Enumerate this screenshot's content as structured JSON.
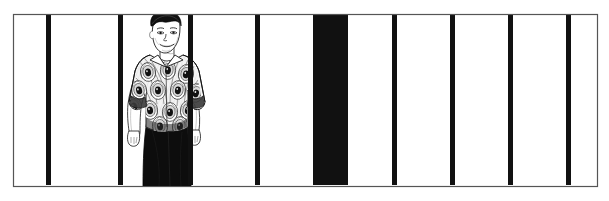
{
  "image": {
    "kind": "comic-panel-illustration",
    "title": "Man standing behind vertical bars",
    "caption": "Black and white comic panel: a smiling young man in a peacock-feather patterned short-sleeve shirt and dark trousers stands behind a row of vertical bars; one bar column is solid black.",
    "width_px": 609,
    "height_px": 201,
    "background_color": "#ffffff",
    "ink_color": "#111111",
    "paper_color": "#fcfcfc"
  },
  "frame": {
    "name": "panel-border",
    "left_px": 13,
    "top_px": 14,
    "right_px": 597,
    "bottom_px": 186,
    "stroke_color": "#555555",
    "stroke_width_px": 1.2
  },
  "bars": {
    "label": "vertical bars",
    "color": "#111111",
    "count": 11,
    "top_px": 15,
    "bottom_px": 185,
    "items": [
      {
        "name": "bar-1",
        "x_px": 46,
        "width_px": 5,
        "fill": "solid-black"
      },
      {
        "name": "bar-2",
        "x_px": 118,
        "width_px": 5,
        "fill": "solid-black"
      },
      {
        "name": "bar-3",
        "x_px": 188,
        "width_px": 5,
        "fill": "solid-black"
      },
      {
        "name": "bar-4",
        "x_px": 255,
        "width_px": 5,
        "fill": "solid-black"
      },
      {
        "name": "bar-5-wide-black-column",
        "x_px": 313,
        "width_px": 35,
        "fill": "solid-black"
      },
      {
        "name": "bar-6",
        "x_px": 392,
        "width_px": 5,
        "fill": "solid-black"
      },
      {
        "name": "bar-7",
        "x_px": 450,
        "width_px": 5,
        "fill": "solid-black"
      },
      {
        "name": "bar-8",
        "x_px": 508,
        "width_px": 5,
        "fill": "solid-black"
      },
      {
        "name": "bar-9",
        "x_px": 566,
        "width_px": 5,
        "fill": "solid-black"
      }
    ]
  },
  "figure": {
    "name": "standing-man",
    "center_x_px": 166,
    "head_top_px": 16,
    "feet_px": 186,
    "hair_color": "#111111",
    "skin_color": "#ffffff",
    "shirt": {
      "name": "peacock-pattern-shirt",
      "pattern": "peacock feather eyespots",
      "sleeve": "short rolled sleeve",
      "base_color": "#f2f2f2",
      "ink_color": "#1a1a1a"
    },
    "trousers": {
      "name": "dark-trousers",
      "color": "#0d0d0d"
    }
  }
}
